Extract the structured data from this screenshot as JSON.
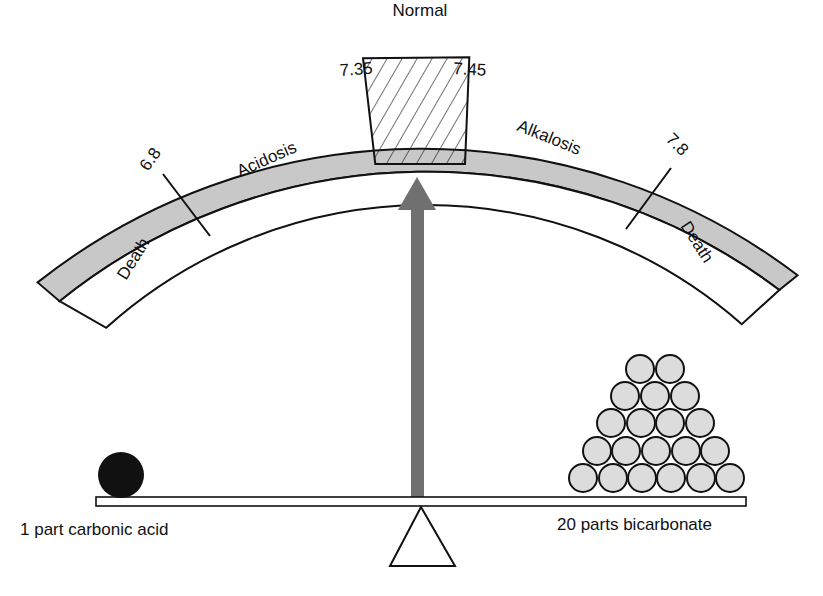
{
  "title": "Normal",
  "scale": {
    "ticks": [
      "6.8",
      "7.35",
      "7.45",
      "7.8"
    ],
    "zones": [
      {
        "label": "Death",
        "range": "< 6.8"
      },
      {
        "label": "Acidosis",
        "range": "6.8 - 7.35"
      },
      {
        "label": "",
        "range": "7.35 - 7.45",
        "pattern": "hatched"
      },
      {
        "label": "Alkalosis",
        "range": "7.45 - 7.8"
      },
      {
        "label": "Death",
        "range": "> 7.8"
      }
    ]
  },
  "balance": {
    "left_label": "1 part carbonic acid",
    "right_label": "20 parts bicarbonate",
    "left_count": 1,
    "right_count": 20
  },
  "colors": {
    "band": "#c8c8c8",
    "arrow": "#707070",
    "ball_dark": "#111111",
    "ball_light": "#dcdcdc"
  }
}
